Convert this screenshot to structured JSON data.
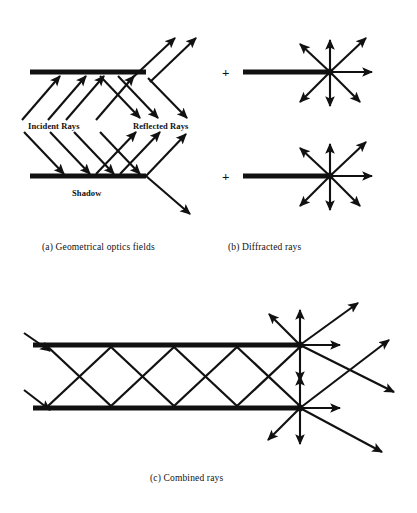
{
  "figure": {
    "width": 417,
    "height": 513,
    "background": "#ffffff",
    "ink_color": "#111111",
    "plate_color": "#111111"
  },
  "labels": {
    "incident_rays": "Incident Rays",
    "reflected_rays": "Reflected Rays",
    "shadow": "Shadow",
    "plus_a": "+",
    "plus_b": "+"
  },
  "captions": {
    "a": "(a) Geometrical optics fields",
    "b": "(b) Diffracted rays",
    "c": "(c) Combined rays"
  },
  "panels": [
    {
      "id": "a",
      "caption": "(a) Geometrical optics fields",
      "description": "Two sub-sketches: incident rays striking a plate and specularly reflected rays; lower sketch shows shadow region.",
      "subfigures": [
        {
          "id": "a-top",
          "plate": {
            "x1": 30,
            "x2": 146,
            "y": 72,
            "thickness": 5
          },
          "incident_ray_count": 4,
          "reflected_ray_count": 3,
          "transmitted_ray_count": 2
        },
        {
          "id": "a-bottom",
          "plate": {
            "x1": 30,
            "x2": 146,
            "y": 176,
            "thickness": 5
          },
          "incident_ray_count": 4,
          "reflected_ray_count": 3,
          "shadow_label": "Shadow"
        }
      ]
    },
    {
      "id": "b",
      "caption": "(b) Diffracted rays",
      "description": "Two sub-sketches, each a half-plane plate whose right-hand edge radiates a fan of diffracted rays in all directions.",
      "subfigures": [
        {
          "id": "b-top",
          "plus_sign": "+",
          "plate": {
            "x1": 243,
            "x2": 330,
            "y": 72,
            "thickness": 5
          },
          "diffraction_point": {
            "x": 330,
            "y": 72
          },
          "ray_directions_deg": [
            0,
            45,
            90,
            135,
            225,
            270,
            315
          ],
          "ray_count": 7
        },
        {
          "id": "b-bottom",
          "plus_sign": "+",
          "plate": {
            "x1": 243,
            "x2": 330,
            "y": 176,
            "thickness": 5
          },
          "diffraction_point": {
            "x": 330,
            "y": 176
          },
          "ray_directions_deg": [
            0,
            45,
            90,
            135,
            225,
            270,
            315
          ],
          "ray_count": 7
        }
      ]
    },
    {
      "id": "c",
      "caption": "(c) Combined rays",
      "description": "Parallel-plate waveguide: zig-zag bouncing rays between two plates plus edge-diffracted ray fans at both open-end edges.",
      "waveguide": {
        "top_plate": {
          "x1": 33,
          "x2": 300,
          "y": 345,
          "thickness": 5
        },
        "bottom_plate": {
          "x1": 33,
          "x2": 300,
          "y": 408,
          "thickness": 5
        },
        "bounce_count": 4,
        "input_arrow_count": 2
      },
      "edges": [
        {
          "id": "c-top-edge",
          "x": 300,
          "y": 345,
          "ray_directions_deg": [
            0,
            45,
            90,
            135,
            225,
            270,
            315
          ]
        },
        {
          "id": "c-bottom-edge",
          "x": 300,
          "y": 408,
          "ray_directions_deg": [
            0,
            45,
            90,
            135,
            225,
            270,
            315
          ]
        }
      ]
    }
  ]
}
